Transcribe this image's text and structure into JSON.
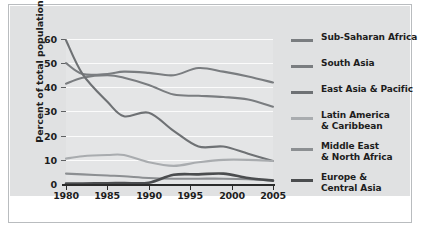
{
  "chart_data": {
    "type": "line",
    "title": "",
    "xlabel": "",
    "ylabel": "Percent of total population",
    "xlim": [
      1980,
      2005
    ],
    "ylim": [
      0,
      60
    ],
    "yticks": [
      0,
      10,
      20,
      30,
      40,
      50,
      60
    ],
    "xticks": [
      1980,
      1985,
      1990,
      1995,
      2000,
      2005
    ],
    "grid": true,
    "legend_position": "right",
    "x": [
      1980,
      1982,
      1985,
      1987,
      1990,
      1993,
      1996,
      1999,
      2002,
      2005
    ],
    "series": [
      {
        "name": "Sub-Saharan Africa",
        "color": "#7a7d80",
        "values": [
          50.0,
          45.5,
          45.5,
          46.5,
          46.0,
          45.0,
          48.0,
          46.5,
          44.5,
          42.0
        ]
      },
      {
        "name": "South Asia",
        "color": "#7a7d80",
        "values": [
          41.5,
          44.0,
          45.0,
          44.0,
          41.0,
          37.0,
          36.5,
          36.0,
          35.0,
          32.0
        ]
      },
      {
        "name": "East Asia & Pacific",
        "color": "#6e7174",
        "values": [
          59.5,
          45.5,
          34.0,
          28.0,
          29.5,
          22.0,
          15.5,
          15.5,
          12.5,
          9.5
        ]
      },
      {
        "name": "Latin America & Caribbean",
        "color": "#a9acaf",
        "values": [
          10.5,
          11.5,
          12.0,
          12.0,
          9.0,
          7.5,
          9.0,
          10.0,
          10.0,
          9.5
        ]
      },
      {
        "name": "Middle East & North Africa",
        "color": "#8c8f92",
        "values": [
          4.3,
          4.0,
          3.5,
          3.2,
          2.5,
          2.2,
          2.2,
          2.2,
          2.0,
          1.5
        ]
      },
      {
        "name": "Europe & Central Asia",
        "color": "#4b4d4f",
        "values": [
          0.2,
          0.2,
          0.3,
          0.4,
          0.5,
          3.8,
          4.0,
          4.3,
          2.5,
          1.4
        ]
      }
    ]
  },
  "axes": {
    "ylabel": "Percent of total population",
    "yticks": [
      "60",
      "50",
      "40",
      "30",
      "20",
      "10",
      "0"
    ],
    "xticks": [
      "1980",
      "1985",
      "1990",
      "1995",
      "2000",
      "2005"
    ]
  },
  "legend": {
    "items": [
      {
        "label_line1": "Sub-Saharan Africa",
        "label_line2": "",
        "color": "#7a7d80"
      },
      {
        "label_line1": "South Asia",
        "label_line2": "",
        "color": "#7a7d80"
      },
      {
        "label_line1": "East Asia & Pacific",
        "label_line2": "",
        "color": "#6e7174"
      },
      {
        "label_line1": "Latin America",
        "label_line2": "& Caribbean",
        "color": "#a9acaf"
      },
      {
        "label_line1": "Middle East",
        "label_line2": "& North Africa",
        "color": "#8c8f92"
      },
      {
        "label_line1": "Europe &",
        "label_line2": "Central Asia",
        "color": "#4b4d4f"
      }
    ]
  }
}
